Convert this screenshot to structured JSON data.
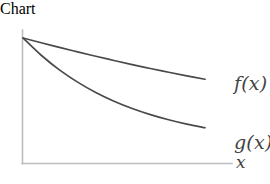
{
  "chart_data": {
    "type": "line",
    "title": "",
    "xlabel": "x",
    "ylabel": "",
    "grid": false,
    "legend_position": "right-inline",
    "axis_style": "open-L-axes-no-ticks",
    "xlim": [
      0,
      1
    ],
    "ylim": [
      0,
      1
    ],
    "annotations": [
      "f(x)",
      "g(x)",
      "x"
    ],
    "series": [
      {
        "name": "f(x)",
        "label": "f(x)",
        "color": "#4a4a4a",
        "description": "slowly decaying convex curve, nearly linear",
        "x": [
          0,
          0.1,
          0.2,
          0.3,
          0.4,
          0.5,
          0.6,
          0.7,
          0.8,
          0.9,
          1.0
        ],
        "y": [
          1.0,
          0.962,
          0.925,
          0.889,
          0.854,
          0.82,
          0.787,
          0.756,
          0.726,
          0.697,
          0.67
        ]
      },
      {
        "name": "g(x)",
        "label": "g(x)",
        "color": "#4a4a4a",
        "description": "rapidly decaying convex curve",
        "x": [
          0,
          0.1,
          0.2,
          0.3,
          0.4,
          0.5,
          0.6,
          0.7,
          0.8,
          0.9,
          1.0
        ],
        "y": [
          1.0,
          0.862,
          0.745,
          0.647,
          0.564,
          0.494,
          0.436,
          0.387,
          0.346,
          0.311,
          0.282
        ]
      }
    ],
    "axes_colors": {
      "axis": "#bdbdbd",
      "curve": "#4a4a4a",
      "background": "#ffffff"
    }
  },
  "labels": {
    "f": "f(x)",
    "g": "g(x)",
    "x_axis": "x"
  }
}
